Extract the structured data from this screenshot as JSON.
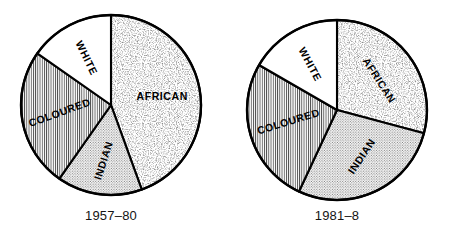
{
  "figure": {
    "width": 450,
    "height": 243,
    "background": "#ffffff",
    "stroke_color": "#000000"
  },
  "charts": [
    {
      "id": "pie-1957-80",
      "caption": "1957–80",
      "center": {
        "x": 111,
        "y": 105
      },
      "radius": 90,
      "slices": [
        {
          "label": "AFRICAN",
          "start_deg": 0,
          "end_deg": 160,
          "fill": "speckle",
          "label_angle_deg": 80,
          "label_radius": 52,
          "label_rotate_deg": 0
        },
        {
          "label": "INDIAN",
          "start_deg": 160,
          "end_deg": 215,
          "fill": "dots",
          "label_angle_deg": 188,
          "label_radius": 56,
          "label_rotate_deg": -72
        },
        {
          "label": "COLOURED",
          "start_deg": 215,
          "end_deg": 305,
          "fill": "vlines",
          "label_angle_deg": 262,
          "label_radius": 52,
          "label_rotate_deg": -20
        },
        {
          "label": "WHITE",
          "start_deg": 305,
          "end_deg": 360,
          "fill": "blank",
          "label_angle_deg": 333,
          "label_radius": 53,
          "label_rotate_deg": 64
        }
      ]
    },
    {
      "id": "pie-1981-8",
      "caption": "1981–8",
      "center": {
        "x": 337,
        "y": 110
      },
      "radius": 90,
      "slices": [
        {
          "label": "AFRICAN",
          "start_deg": 0,
          "end_deg": 105,
          "fill": "speckle",
          "label_angle_deg": 55,
          "label_radius": 52,
          "label_rotate_deg": 57
        },
        {
          "label": "INDIAN",
          "start_deg": 105,
          "end_deg": 205,
          "fill": "dots",
          "label_angle_deg": 152,
          "label_radius": 52,
          "label_rotate_deg": -56
        },
        {
          "label": "COLOURED",
          "start_deg": 205,
          "end_deg": 300,
          "fill": "vlines",
          "label_angle_deg": 257,
          "label_radius": 50,
          "label_rotate_deg": -17
        },
        {
          "label": "WHITE",
          "start_deg": 300,
          "end_deg": 360,
          "fill": "blank",
          "label_angle_deg": 330,
          "label_radius": 53,
          "label_rotate_deg": 62
        }
      ]
    }
  ],
  "chart_data": {
    "type": "pie",
    "title": "",
    "subtitle": "",
    "xlabel": "",
    "ylabel": "",
    "grid": false,
    "legend": "none",
    "note": "Two pie charts comparing population group shares across two periods. Slice sizes read off sector boundary angles; values are percentages of the whole circle.",
    "categories": [
      "AFRICAN",
      "INDIAN",
      "COLOURED",
      "WHITE"
    ],
    "series": [
      {
        "name": "1957–80",
        "values": [
          44.4,
          15.3,
          25.0,
          15.3
        ],
        "angles_deg": [
          160,
          55,
          90,
          55
        ]
      },
      {
        "name": "1981–8",
        "values": [
          29.2,
          27.8,
          26.4,
          16.7
        ],
        "angles_deg": [
          105,
          100,
          95,
          60
        ]
      }
    ],
    "fills": {
      "AFRICAN": "coarse random speckle",
      "INDIAN": "fine regular dot screen",
      "COLOURED": "fine vertical hatch lines",
      "WHITE": "blank / white"
    }
  }
}
